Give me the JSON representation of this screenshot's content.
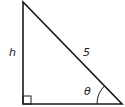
{
  "diagram": {
    "type": "right-triangle",
    "labels": {
      "vertical_side": "h",
      "hypotenuse": "5",
      "angle": "θ"
    },
    "colors": {
      "stroke": "#1a1a1a",
      "background": "#ffffff"
    }
  }
}
